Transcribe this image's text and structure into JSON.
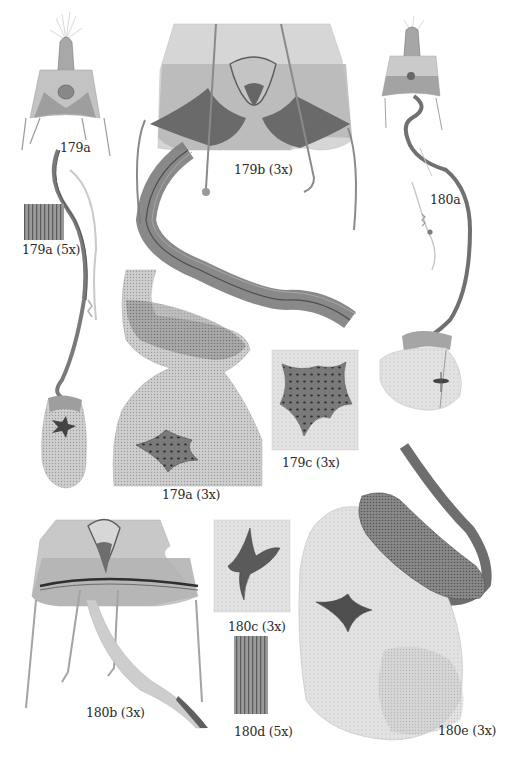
{
  "figure": {
    "type": "microscopy plate",
    "background": "#ffffff",
    "ink_color": "#2a2a2a"
  },
  "panels": [
    {
      "id": "179a",
      "label": "179a",
      "x": 60,
      "y": 140
    },
    {
      "id": "179a-5x",
      "label": "179a (5x)",
      "x": 22,
      "y": 242
    },
    {
      "id": "179b-3x",
      "label": "179b (3x)",
      "x": 234,
      "y": 162
    },
    {
      "id": "180a",
      "label": "180a",
      "x": 430,
      "y": 192
    },
    {
      "id": "179a-3x",
      "label": "179a (3x)",
      "x": 162,
      "y": 487
    },
    {
      "id": "179c-3x",
      "label": "179c (3x)",
      "x": 282,
      "y": 455
    },
    {
      "id": "180c-3x",
      "label": "180c (3x)",
      "x": 228,
      "y": 619
    },
    {
      "id": "180b-3x",
      "label": "180b (3x)",
      "x": 86,
      "y": 705
    },
    {
      "id": "180d-5x",
      "label": "180d (5x)",
      "x": 234,
      "y": 724
    },
    {
      "id": "180e-3x",
      "label": "180e (3x)",
      "x": 438,
      "y": 723
    }
  ]
}
